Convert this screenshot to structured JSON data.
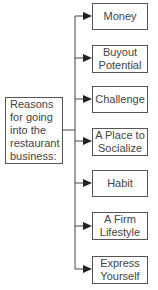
{
  "diagram": {
    "root": {
      "label": "Reasons for going into the restaurant business:"
    },
    "children": [
      {
        "label": "Money"
      },
      {
        "label": "Buyout Potential"
      },
      {
        "label": "Challenge"
      },
      {
        "label": "A Place to Socialize"
      },
      {
        "label": "Habit"
      },
      {
        "label": "A Firm Lifestyle"
      },
      {
        "label": "Express Yourself"
      }
    ]
  }
}
